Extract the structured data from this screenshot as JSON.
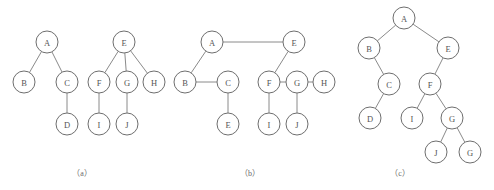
{
  "figure": {
    "background_color": "#ffffff",
    "node_fill": "#ffffff",
    "node_stroke": "#6e6e6e",
    "edge_color": "#8a8a8a",
    "label_color": "#555555",
    "node_radius": 11
  },
  "panels": [
    {
      "id": "panel-a",
      "caption": "（a）",
      "caption_x": 82,
      "caption_y": 176,
      "description": "forest of two general trees",
      "nodes": [
        {
          "id": "a-A",
          "label": "A",
          "x": 47,
          "y": 42
        },
        {
          "id": "a-B",
          "label": "B",
          "x": 24,
          "y": 82
        },
        {
          "id": "a-C",
          "label": "C",
          "x": 67,
          "y": 82
        },
        {
          "id": "a-D",
          "label": "D",
          "x": 67,
          "y": 124
        },
        {
          "id": "a-E",
          "label": "E",
          "x": 124,
          "y": 42
        },
        {
          "id": "a-F",
          "label": "F",
          "x": 99,
          "y": 82
        },
        {
          "id": "a-G",
          "label": "G",
          "x": 127,
          "y": 82
        },
        {
          "id": "a-H",
          "label": "H",
          "x": 154,
          "y": 82
        },
        {
          "id": "a-I",
          "label": "I",
          "x": 99,
          "y": 124
        },
        {
          "id": "a-J",
          "label": "J",
          "x": 127,
          "y": 124
        }
      ],
      "edges": [
        {
          "from": "a-A",
          "to": "a-B"
        },
        {
          "from": "a-A",
          "to": "a-C"
        },
        {
          "from": "a-C",
          "to": "a-D"
        },
        {
          "from": "a-E",
          "to": "a-F"
        },
        {
          "from": "a-E",
          "to": "a-G"
        },
        {
          "from": "a-E",
          "to": "a-H"
        },
        {
          "from": "a-F",
          "to": "a-I"
        },
        {
          "from": "a-G",
          "to": "a-J"
        }
      ]
    },
    {
      "id": "panel-b",
      "caption": "（b）",
      "caption_x": 250,
      "caption_y": 176,
      "description": "child-sibling linked representation",
      "nodes": [
        {
          "id": "b-A",
          "label": "A",
          "x": 212,
          "y": 42
        },
        {
          "id": "b-E",
          "label": "E",
          "x": 294,
          "y": 42
        },
        {
          "id": "b-B",
          "label": "B",
          "x": 185,
          "y": 82
        },
        {
          "id": "b-C",
          "label": "C",
          "x": 228,
          "y": 82
        },
        {
          "id": "b-F",
          "label": "F",
          "x": 269,
          "y": 82
        },
        {
          "id": "b-G",
          "label": "G",
          "x": 297,
          "y": 82
        },
        {
          "id": "b-H",
          "label": "H",
          "x": 324,
          "y": 82
        },
        {
          "id": "b-Ec",
          "label": "E",
          "x": 228,
          "y": 124
        },
        {
          "id": "b-I",
          "label": "I",
          "x": 269,
          "y": 124
        },
        {
          "id": "b-J",
          "label": "J",
          "x": 297,
          "y": 124
        }
      ],
      "edges": [
        {
          "from": "b-A",
          "to": "b-E"
        },
        {
          "from": "b-A",
          "to": "b-B"
        },
        {
          "from": "b-B",
          "to": "b-C"
        },
        {
          "from": "b-C",
          "to": "b-Ec"
        },
        {
          "from": "b-E",
          "to": "b-F"
        },
        {
          "from": "b-F",
          "to": "b-G"
        },
        {
          "from": "b-G",
          "to": "b-H"
        },
        {
          "from": "b-F",
          "to": "b-I"
        },
        {
          "from": "b-G",
          "to": "b-J"
        }
      ]
    },
    {
      "id": "panel-c",
      "caption": "（c）",
      "caption_x": 400,
      "caption_y": 176,
      "description": "corresponding binary tree",
      "nodes": [
        {
          "id": "c-A",
          "label": "A",
          "x": 404,
          "y": 18
        },
        {
          "id": "c-B",
          "label": "B",
          "x": 369,
          "y": 48
        },
        {
          "id": "c-E",
          "label": "E",
          "x": 448,
          "y": 48
        },
        {
          "id": "c-C",
          "label": "C",
          "x": 389,
          "y": 84
        },
        {
          "id": "c-F",
          "label": "F",
          "x": 430,
          "y": 84
        },
        {
          "id": "c-D",
          "label": "D",
          "x": 370,
          "y": 118
        },
        {
          "id": "c-I",
          "label": "I",
          "x": 412,
          "y": 118
        },
        {
          "id": "c-G",
          "label": "G",
          "x": 452,
          "y": 118
        },
        {
          "id": "c-J",
          "label": "J",
          "x": 436,
          "y": 152
        },
        {
          "id": "c-G2",
          "label": "G",
          "x": 470,
          "y": 152
        }
      ],
      "edges": [
        {
          "from": "c-A",
          "to": "c-B"
        },
        {
          "from": "c-A",
          "to": "c-E"
        },
        {
          "from": "c-B",
          "to": "c-C"
        },
        {
          "from": "c-C",
          "to": "c-D"
        },
        {
          "from": "c-E",
          "to": "c-F"
        },
        {
          "from": "c-F",
          "to": "c-I"
        },
        {
          "from": "c-F",
          "to": "c-G"
        },
        {
          "from": "c-G",
          "to": "c-J"
        },
        {
          "from": "c-G",
          "to": "c-G2"
        }
      ]
    }
  ]
}
